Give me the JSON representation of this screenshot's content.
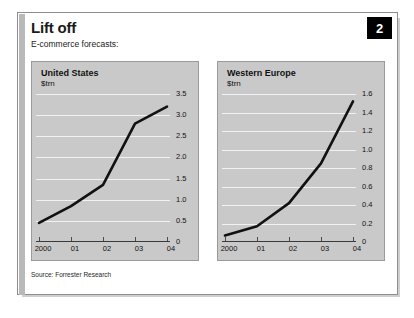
{
  "figure": {
    "title": "Lift off",
    "subtitle": "E-commerce forecasts:",
    "badge": "2",
    "source": "Source: Forrester Research",
    "accent_color": "#000000",
    "panel_bg": "#c9c9c9",
    "gridline_color": "#f2f2f2",
    "line_color": "#111111"
  },
  "chart_data": [
    {
      "type": "line",
      "title": "United States",
      "ylabel": "$trn",
      "xlabel": "",
      "categories": [
        "2000",
        "01",
        "02",
        "03",
        "04"
      ],
      "values": [
        0.45,
        0.85,
        1.35,
        2.8,
        3.2
      ],
      "ylim": [
        0,
        3.5
      ],
      "yticks": [
        0,
        0.5,
        1.0,
        1.5,
        2.0,
        2.5,
        3.0,
        3.5
      ],
      "ytick_labels": [
        "0",
        "0.5",
        "1.0",
        "1.5",
        "2.0",
        "2.5",
        "3.0",
        "3.5"
      ],
      "grid": true,
      "legend": "none"
    },
    {
      "type": "line",
      "title": "Western Europe",
      "ylabel": "$trn",
      "xlabel": "",
      "categories": [
        "2000",
        "01",
        "02",
        "03",
        "04"
      ],
      "values": [
        0.07,
        0.17,
        0.42,
        0.85,
        1.52
      ],
      "ylim": [
        0,
        1.6
      ],
      "yticks": [
        0,
        0.2,
        0.4,
        0.6,
        0.8,
        1.0,
        1.2,
        1.4,
        1.6
      ],
      "ytick_labels": [
        "0",
        "0.2",
        "0.4",
        "0.6",
        "0.8",
        "1.0",
        "1.2",
        "1.4",
        "1.6"
      ],
      "grid": true,
      "legend": "none"
    }
  ]
}
